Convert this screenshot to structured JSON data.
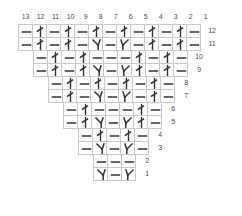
{
  "chart": {
    "type": "knitting-chart",
    "columns": 13,
    "rows": 12,
    "cell_width": 15,
    "cell_height": 14,
    "grid_color": "#c9c9c9",
    "symbol_color": "#333333",
    "text_color": "#4a4a4a",
    "background": "#ffffff",
    "column_headers": [
      "13",
      "12",
      "11",
      "10",
      "9",
      "8",
      "7",
      "6",
      "5",
      "4",
      "3",
      "2",
      "1"
    ],
    "symbol_legend": {
      "dash": "purl-stitch",
      "twist": "twisted-knit-stitch",
      "dec_left": "left-leaning-decrease",
      "dec_right": "right-leaning-decrease"
    },
    "rows_data": [
      {
        "number": "12",
        "indent": 0,
        "width": 13,
        "cells": [
          "dash",
          "twist",
          "dash",
          "twist",
          "dash",
          "twist",
          "dash",
          "twist",
          "dash",
          "twist",
          "dash",
          "twist",
          "dash"
        ]
      },
      {
        "number": "11",
        "indent": 0,
        "width": 13,
        "cells": [
          "dash",
          "twist",
          "dash",
          "twist",
          "dash",
          "dec_left",
          "dash",
          "dec_right",
          "dash",
          "twist",
          "dash",
          "twist",
          "dash"
        ]
      },
      {
        "number": "10",
        "indent": 1,
        "width": 11,
        "cells": [
          "dash",
          "twist",
          "dash",
          "twist",
          "dash",
          "dash",
          "dash",
          "twist",
          "dash",
          "twist",
          "dash"
        ]
      },
      {
        "number": "9",
        "indent": 1,
        "width": 11,
        "cells": [
          "dash",
          "twist",
          "dash",
          "twist",
          "dec_left",
          "dash",
          "dec_right",
          "twist",
          "dash",
          "twist",
          "dash"
        ]
      },
      {
        "number": "8",
        "indent": 2,
        "width": 9,
        "cells": [
          "dash",
          "twist",
          "dash",
          "twist",
          "dash",
          "twist",
          "dash",
          "twist",
          "dash"
        ]
      },
      {
        "number": "7",
        "indent": 2,
        "width": 9,
        "cells": [
          "dash",
          "twist",
          "dash",
          "dec_left",
          "dash",
          "dec_right",
          "dash",
          "twist",
          "dash"
        ]
      },
      {
        "number": "6",
        "indent": 3,
        "width": 7,
        "cells": [
          "dash",
          "twist",
          "dash",
          "dash",
          "dash",
          "twist",
          "dash"
        ]
      },
      {
        "number": "5",
        "indent": 3,
        "width": 7,
        "cells": [
          "dash",
          "twist",
          "dec_left",
          "dash",
          "dec_right",
          "twist",
          "dash"
        ]
      },
      {
        "number": "4",
        "indent": 4,
        "width": 5,
        "cells": [
          "dash",
          "twist",
          "dash",
          "twist",
          "dash"
        ]
      },
      {
        "number": "3",
        "indent": 4,
        "width": 5,
        "cells": [
          "dash",
          "dec_left",
          "dash",
          "dec_right",
          "dash"
        ]
      },
      {
        "number": "2",
        "indent": 5,
        "width": 3,
        "cells": [
          "dash",
          "dash",
          "dash"
        ]
      },
      {
        "number": "1",
        "indent": 5,
        "width": 3,
        "cells": [
          "dec_left",
          "dash",
          "dec_right"
        ]
      }
    ]
  }
}
